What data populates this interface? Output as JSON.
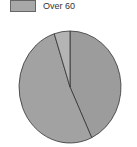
{
  "chart_data": {
    "type": "pie",
    "title": "",
    "legend": [
      {
        "label": "Over 60",
        "color": "#a8a8a8"
      }
    ],
    "slices": [
      {
        "label": "",
        "value": 43,
        "color": "#9c9c9c"
      },
      {
        "label": "",
        "value": 52,
        "color": "#a2a2a2"
      },
      {
        "label": "Over 60",
        "value": 5,
        "color": "#b4b4b4"
      }
    ],
    "start_angle_deg": 0,
    "direction": "clockwise"
  },
  "legend": {
    "label": "Over 60"
  }
}
